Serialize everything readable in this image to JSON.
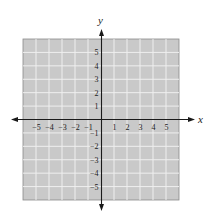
{
  "chart_data": {
    "type": "coordinate-plane",
    "title": "",
    "xlabel": "x",
    "ylabel": "y",
    "xlim": [
      -6,
      6
    ],
    "ylim": [
      -6,
      6
    ],
    "grid": true,
    "x_tick_labels": [
      "-5",
      "-4",
      "-3",
      "-2",
      "-1",
      "1",
      "2",
      "3",
      "4",
      "5"
    ],
    "y_tick_labels": [
      "5",
      "4",
      "3",
      "2",
      "1",
      "-1",
      "-2",
      "-3",
      "-4",
      "-5"
    ],
    "series": []
  },
  "axes": {
    "x_label": "x",
    "y_label": "y",
    "x_ticks": [
      {
        "label": "−5",
        "value": -5
      },
      {
        "label": "−4",
        "value": -4
      },
      {
        "label": "−3",
        "value": -3
      },
      {
        "label": "−2",
        "value": -2
      },
      {
        "label": "−1",
        "value": -1
      },
      {
        "label": "1",
        "value": 1
      },
      {
        "label": "2",
        "value": 2
      },
      {
        "label": "3",
        "value": 3
      },
      {
        "label": "4",
        "value": 4
      },
      {
        "label": "5",
        "value": 5
      }
    ],
    "y_ticks": [
      {
        "label": "5",
        "value": 5
      },
      {
        "label": "4",
        "value": 4
      },
      {
        "label": "3",
        "value": 3
      },
      {
        "label": "2",
        "value": 2
      },
      {
        "label": "1",
        "value": 1
      },
      {
        "label": "−1",
        "value": -1
      },
      {
        "label": "−2",
        "value": -2
      },
      {
        "label": "−3",
        "value": -3
      },
      {
        "label": "−4",
        "value": -4
      },
      {
        "label": "−5",
        "value": -5
      }
    ]
  },
  "colors": {
    "grid_fill": "#c9c9c9",
    "grid_line": "#efefef",
    "axis": "#1a1a1a",
    "text": "#222222"
  }
}
